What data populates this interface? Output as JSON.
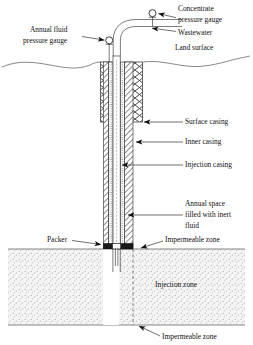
{
  "figure": {
    "background_color": "#ffffff",
    "line_color": "#111111",
    "zone_fill_color": "#f2f2f2",
    "zone_dot_color": "#9a9a9a"
  },
  "labels": {
    "annual_fluid_pressure_gauge": "Annual fluid\npressure gauge",
    "annual_fluid_pressure_gauge_line1": "Annual fluid",
    "annual_fluid_pressure_gauge_line2": "pressure gauge",
    "concentrate_pressure_gauge_line1": "Concentrate",
    "concentrate_pressure_gauge_line2": "pressure gauge",
    "wastewater": "Wastewater",
    "land_surface": "Land surface",
    "surface_casing": "Surface casing",
    "inner_casing": "Inner casing",
    "injection_casing": "Injection casing",
    "annual_space_line1": "Annual space",
    "annual_space_line2": "filled with inert",
    "annual_space_line3": "fluid",
    "packer": "Packer",
    "impermeable_zone_upper": "Impermeable zone",
    "injection_zone": "Injection zone",
    "impermeable_zone_lower": "Impermeable zone"
  },
  "components": [
    {
      "name": "annual-fluid-pressure-gauge",
      "type": "gauge"
    },
    {
      "name": "concentrate-pressure-gauge",
      "type": "gauge"
    },
    {
      "name": "wastewater-pipe",
      "type": "pipe"
    },
    {
      "name": "surface-casing",
      "type": "casing"
    },
    {
      "name": "inner-casing",
      "type": "casing"
    },
    {
      "name": "injection-casing",
      "type": "casing"
    },
    {
      "name": "annular-space",
      "type": "fill"
    },
    {
      "name": "packer",
      "type": "seal"
    },
    {
      "name": "injection-tubing",
      "type": "tubing"
    }
  ],
  "zones": [
    {
      "name": "impermeable-zone-upper",
      "label": "Impermeable zone"
    },
    {
      "name": "injection-zone",
      "label": "Injection zone"
    },
    {
      "name": "impermeable-zone-lower",
      "label": "Impermeable zone"
    }
  ]
}
